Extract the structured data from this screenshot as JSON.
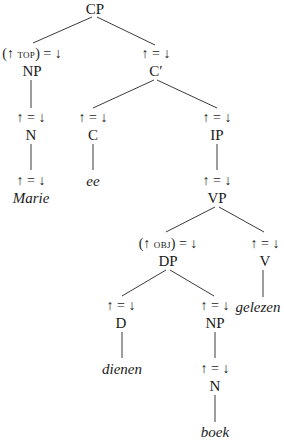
{
  "diagram": {
    "type": "c-structure tree (LFG)",
    "nodes": {
      "cp": {
        "category": "CP"
      },
      "np_top": {
        "annotation_pre": "(↑ ",
        "annotation_feat": "TOP",
        "annotation_post": ") = ↓",
        "category": "NP"
      },
      "c_bar": {
        "annotation": "↑ = ↓",
        "category": "C′"
      },
      "n_marie": {
        "annotation": "↑ = ↓",
        "category": "N"
      },
      "marie_ann": {
        "annotation": "↑ = ↓"
      },
      "marie": {
        "word": "Marie"
      },
      "c": {
        "annotation": "↑ = ↓",
        "category": "C"
      },
      "ee": {
        "word": "ee"
      },
      "ip": {
        "annotation": "↑ = ↓",
        "category": "IP"
      },
      "vp": {
        "annotation": "↑ = ↓",
        "category": "VP"
      },
      "dp": {
        "annotation_pre": "(↑ ",
        "annotation_feat": "OBJ",
        "annotation_post": ") = ↓",
        "category": "DP"
      },
      "v": {
        "annotation": "↑ = ↓",
        "category": "V"
      },
      "gelezen": {
        "word": "gelezen"
      },
      "d": {
        "annotation": "↑ = ↓",
        "category": "D"
      },
      "dienen": {
        "word": "dienen"
      },
      "np_obj": {
        "annotation": "↑ = ↓",
        "category": "NP"
      },
      "n_boek": {
        "annotation": "↑ = ↓",
        "category": "N"
      },
      "boek": {
        "word": "boek"
      }
    }
  }
}
